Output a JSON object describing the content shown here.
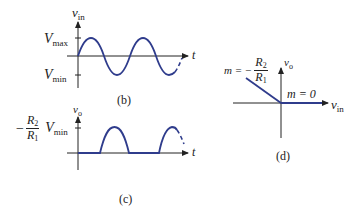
{
  "figure": {
    "panel_b": {
      "caption": "(b)",
      "y_axis_label": "v",
      "y_axis_label_sub": "in",
      "x_axis_label": "t",
      "tick_top_label": "V",
      "tick_top_sub": "max",
      "tick_bottom_label": "V",
      "tick_bottom_sub": "min",
      "signal": "sine wave input"
    },
    "panel_c": {
      "caption": "(c)",
      "y_axis_label": "v",
      "y_axis_label_sub": "o",
      "x_axis_label": "t",
      "tick_label_prefix": "−",
      "tick_label_num": "R",
      "tick_label_num_sub": "2",
      "tick_label_den": "R",
      "tick_label_den_sub": "1",
      "tick_label_v": "V",
      "tick_label_v_sub": "min",
      "signal": "half-wave rectified output"
    },
    "panel_d": {
      "caption": "(d)",
      "y_axis_label": "v",
      "y_axis_label_sub": "o",
      "x_axis_label": "v",
      "x_axis_label_sub": "in",
      "slope_left_prefix": "m = −",
      "slope_left_num": "R",
      "slope_left_num_sub": "2",
      "slope_left_den": "R",
      "slope_left_den_sub": "1",
      "slope_right": "m = 0"
    },
    "colors": {
      "curve": "#2f3c8c",
      "axis": "#222222"
    }
  }
}
